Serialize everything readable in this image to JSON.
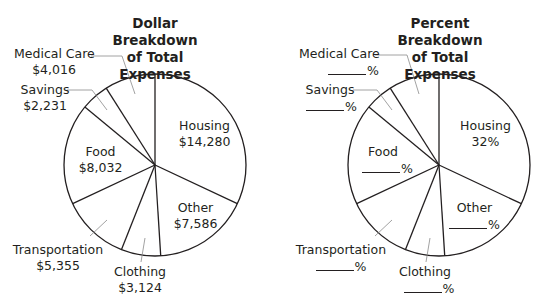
{
  "chart_data": [
    {
      "type": "pie",
      "title": "Dollar Breakdown of Total Expenses",
      "title_lines": [
        "Dollar Breakdown",
        "of Total Expenses"
      ],
      "categories": [
        "Housing",
        "Other",
        "Clothing",
        "Transportation",
        "Food",
        "Savings",
        "Medical Care"
      ],
      "values": [
        14280,
        7586,
        3124,
        5355,
        8032,
        2231,
        4016
      ],
      "value_labels": [
        "$14,280",
        "$7,586",
        "$3,124",
        "$5,355",
        "$8,032",
        "$2,231",
        "$4,016"
      ],
      "start_angle": "top (12 o'clock)",
      "direction": "clockwise"
    },
    {
      "type": "pie",
      "title": "Percent Breakdown of Total Expenses",
      "title_lines": [
        "Percent Breakdown",
        "of Total Expenses"
      ],
      "categories": [
        "Housing",
        "Other",
        "Clothing",
        "Transportation",
        "Food",
        "Savings",
        "Medical Care"
      ],
      "values": [
        32,
        null,
        null,
        null,
        null,
        null,
        null
      ],
      "value_labels": [
        "32%",
        "____%",
        "____%",
        "____%",
        "____%",
        "____%",
        "____%"
      ],
      "note": "Only Housing percent given; others are blanks to fill in",
      "start_angle": "top (12 o'clock)",
      "direction": "clockwise"
    }
  ],
  "left": {
    "title1": "Dollar Breakdown",
    "title2": "of Total Expenses",
    "housing": {
      "name": "Housing",
      "value": "$14,280"
    },
    "other": {
      "name": "Other",
      "value": "$7,586"
    },
    "clothing": {
      "name": "Clothing",
      "value": "$3,124"
    },
    "transportation": {
      "name": "Transportation",
      "value": "$5,355"
    },
    "food": {
      "name": "Food",
      "value": "$8,032"
    },
    "savings": {
      "name": "Savings",
      "value": "$2,231"
    },
    "medical": {
      "name": "Medical Care",
      "value": "$4,016"
    }
  },
  "right": {
    "title1": "Percent Breakdown",
    "title2": "of Total Expenses",
    "pct": "%",
    "housing": {
      "name": "Housing",
      "value": "32%"
    },
    "other": {
      "name": "Other"
    },
    "clothing": {
      "name": "Clothing"
    },
    "transportation": {
      "name": "Transportation"
    },
    "food": {
      "name": "Food"
    },
    "savings": {
      "name": "Savings"
    },
    "medical": {
      "name": "Medical Care"
    }
  },
  "colors": {
    "stroke": "#231f20",
    "leader": "#8a8a8a",
    "fill": "#ffffff"
  }
}
